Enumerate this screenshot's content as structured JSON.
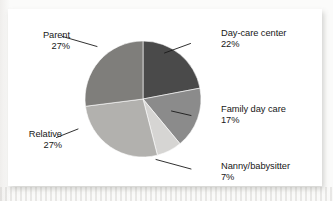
{
  "chart_data": {
    "type": "pie",
    "title": "",
    "subtitle": "",
    "xlabel": "",
    "ylabel": "",
    "legend_position": "none",
    "grid": false,
    "units": "percent",
    "categories": [
      "Day-care center",
      "Family day care",
      "Nanny/babysitter",
      "Relative",
      "Parent"
    ],
    "values": [
      22,
      17,
      7,
      27,
      27
    ],
    "value_labels": [
      "22%",
      "17%",
      "7%",
      "27%",
      "27%"
    ],
    "slices": [
      {
        "label": "Day-care center",
        "value": 22,
        "value_label": "22%",
        "color": "#4a4a4a",
        "label_side": "right"
      },
      {
        "label": "Family day care",
        "value": 17,
        "value_label": "17%",
        "color": "#8b8b8b",
        "label_side": "right"
      },
      {
        "label": "Nanny/babysitter",
        "value": 7,
        "value_label": "7%",
        "color": "#d6d5d3",
        "label_side": "right"
      },
      {
        "label": "Relative",
        "value": 27,
        "value_label": "27%",
        "color": "#b2b1ae",
        "label_side": "left"
      },
      {
        "label": "Parent",
        "value": 27,
        "value_label": "27%",
        "color": "#7f7e7b",
        "label_side": "left"
      }
    ],
    "total": 100,
    "start_angle_deg": 0,
    "direction": "clockwise"
  },
  "panel": {
    "background_color": "#ffffff",
    "page_background_color": "#fbfbfa"
  },
  "labels": {
    "daycare": {
      "name": "Day-care center",
      "value": "22%"
    },
    "familydaycare": {
      "name": "Family day care",
      "value": "17%"
    },
    "nanny": {
      "name": "Nanny/babysitter",
      "value": "7%"
    },
    "relative": {
      "name": "Relative",
      "value": "27%"
    },
    "parent": {
      "name": "Parent",
      "value": "27%"
    }
  }
}
